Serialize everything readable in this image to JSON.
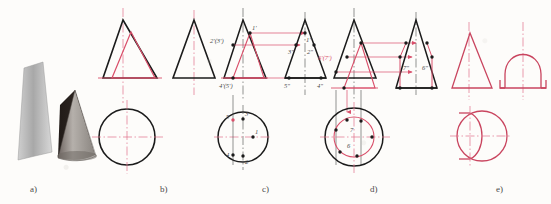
{
  "figure": {
    "panels": [
      {
        "id": "a",
        "label": "a)",
        "caption": "photograph of cut cone model"
      },
      {
        "id": "b",
        "label": "b)",
        "caption": "front view, side view and top view outlines"
      },
      {
        "id": "c",
        "label": "c)",
        "caption": "construction of points 1-5"
      },
      {
        "id": "d",
        "label": "d)",
        "caption": "construction of points 6 and 7"
      },
      {
        "id": "e",
        "label": "e)",
        "caption": "finished three views"
      }
    ],
    "colors": {
      "black_line": "#1b1b1b",
      "red_line": "#d94f6a",
      "center_line": "#e0708a",
      "label_text": "#4a4a4a",
      "photo_light": "#b9b9b9",
      "photo_dark": "#2a2320"
    },
    "panel_c_labels": {
      "front_view": [
        "1'",
        "2'(3')",
        "4'(5')"
      ],
      "side_view": [
        "1\"",
        "3\"",
        "2\"",
        "5\"",
        "4\""
      ],
      "top_view": [
        "5",
        "3",
        "1",
        "4",
        "2"
      ]
    },
    "panel_d_labels": {
      "front_view": [
        "6'(7')"
      ],
      "side_view": [
        "7\"",
        "6\""
      ],
      "top_view": [
        "7",
        "6"
      ]
    },
    "line_types": {
      "visible": "continuous thick",
      "center": "dash-dot thin",
      "projection": "continuous thin with arrow"
    }
  }
}
